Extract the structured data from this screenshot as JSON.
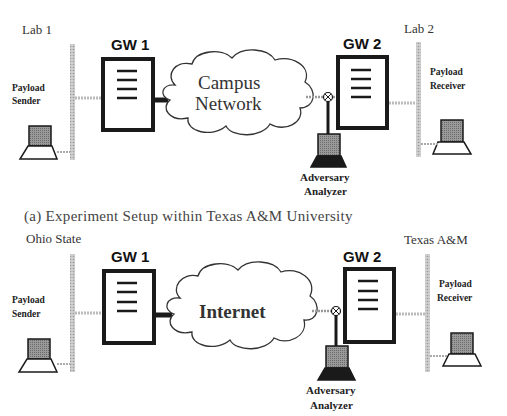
{
  "figure_a": {
    "left_site": "Lab 1",
    "right_site": "Lab 2",
    "gw1": "GW 1",
    "gw2": "GW 2",
    "sender": [
      "Payload",
      "Sender"
    ],
    "receiver": [
      "Payload",
      "Receiver"
    ],
    "cloud": [
      "Campus",
      "Network"
    ],
    "adversary": [
      "Adversary",
      "Analyzer"
    ],
    "caption": "(a) Experiment Setup within Texas A&M University"
  },
  "figure_b": {
    "left_site": "Ohio State",
    "right_site": "Texas A&M",
    "gw1": "GW 1",
    "gw2": "GW 2",
    "sender": [
      "Payload",
      "Sender"
    ],
    "receiver": [
      "Payload",
      "Receiver"
    ],
    "cloud": [
      "Internet"
    ],
    "adversary": [
      "Adversary",
      "Analyzer"
    ]
  },
  "colors": {
    "stroke": "#1a1a1a",
    "hatch": "#bdbdbd",
    "screen": "#8a8a8a"
  }
}
